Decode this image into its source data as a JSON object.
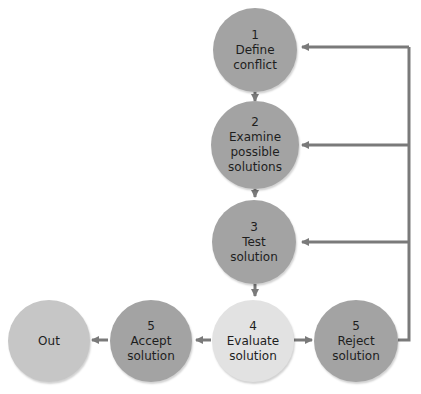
{
  "diagram": {
    "title": "",
    "nodes": [
      {
        "id": "n1",
        "number": "1",
        "line1": "Define",
        "line2": "conflict",
        "line3": ""
      },
      {
        "id": "n2",
        "number": "2",
        "line1": "Examine",
        "line2": "possible",
        "line3": "solutions"
      },
      {
        "id": "n3",
        "number": "3",
        "line1": "Test",
        "line2": "solution",
        "line3": ""
      },
      {
        "id": "n4",
        "number": "4",
        "line1": "Evaluate",
        "line2": "solution",
        "line3": ""
      },
      {
        "id": "n5a",
        "number": "5",
        "line1": "Accept",
        "line2": "solution",
        "line3": ""
      },
      {
        "id": "n5r",
        "number": "5",
        "line1": "Reject",
        "line2": "solution",
        "line3": ""
      },
      {
        "id": "out",
        "number": "",
        "line1": "Out",
        "line2": "",
        "line3": ""
      }
    ],
    "edges": [
      {
        "from": "n1",
        "to": "n2"
      },
      {
        "from": "n2",
        "to": "n3"
      },
      {
        "from": "n3",
        "to": "n4"
      },
      {
        "from": "n4",
        "to": "n5a"
      },
      {
        "from": "n4",
        "to": "n5r"
      },
      {
        "from": "n5a",
        "to": "out"
      },
      {
        "from": "n5r",
        "to": "n1"
      },
      {
        "from": "n5r",
        "to": "n2"
      },
      {
        "from": "n5r",
        "to": "n3"
      }
    ],
    "colors": {
      "dark_node": "#a3a3a3",
      "light_node": "#e2e2e2",
      "out_node": "#c6c6c6",
      "arrow": "#7a7a7a"
    }
  }
}
